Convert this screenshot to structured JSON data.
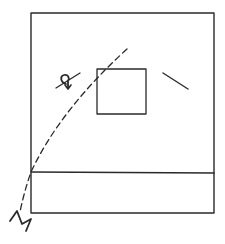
{
  "figure": {
    "type": "hand-drawn line diagram",
    "ink_color": "#2a2a2a",
    "background": "#ffffff",
    "outer_frame": {
      "x": 31,
      "y": 13,
      "width": 183,
      "height": 200
    },
    "divider_line": {
      "x1": 31,
      "y1": 172,
      "x2": 214,
      "y2": 173
    },
    "inner_square": {
      "x": 97,
      "y": 69,
      "width": 49,
      "height": 45
    },
    "right_stroke": {
      "x1": 163,
      "y1": 73,
      "x2": 188,
      "y2": 89
    },
    "dashed_arc": {
      "path": "M127,49 Q60,110 31,172 Q24,192 20,212",
      "dash": "6,4"
    },
    "symbol_cross_line": {
      "x1": 56,
      "y1": 88,
      "x2": 80,
      "y2": 73
    },
    "symbol_glyph": "loop-with-arrow",
    "break_mark": "zigzag"
  }
}
